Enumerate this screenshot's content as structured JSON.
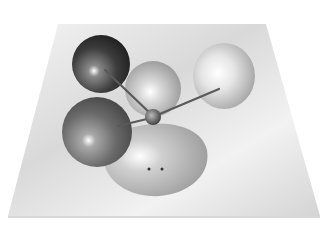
{
  "figure": {
    "colors": {
      "background": "#ffffff",
      "plane": "#e6e6e6",
      "dark_atom": "#3a3a3a",
      "mid_atom": "#6a6a6a",
      "light_atom": "#cfcfcf",
      "lobe": "#bdbdbd",
      "bond": "#5a5a5a"
    },
    "lone_pair_dots": 2
  }
}
